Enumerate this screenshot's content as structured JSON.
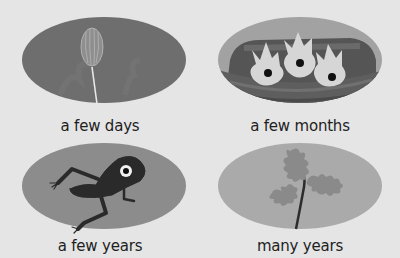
{
  "background_color": "#e5e5e5",
  "cards": [
    {
      "label": "a few days",
      "illustration": "seedling-sprout",
      "ellipse_color": "#6e6e6e"
    },
    {
      "label": "a few months",
      "illustration": "baby-birds-in-nest",
      "ellipse_color": "#a2a2a2"
    },
    {
      "label": "a few years",
      "illustration": "frog",
      "ellipse_color": "#8c8c8c"
    },
    {
      "label": "many years",
      "illustration": "oak-sapling",
      "ellipse_color": "#aaaaaa"
    }
  ]
}
